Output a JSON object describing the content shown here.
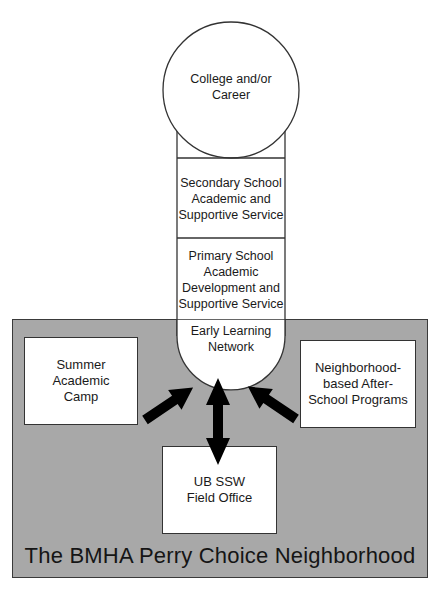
{
  "diagram": {
    "region": {
      "title": "The BMHA Perry Choice Neighborhood",
      "fill_color": "#a8a8a8"
    },
    "pipeline": [
      {
        "id": "college-career",
        "label": "College and/or\nCareer",
        "shape": "circle-top"
      },
      {
        "id": "secondary",
        "label": "Secondary School\nAcademic and\nSupportive Service",
        "shape": "rect"
      },
      {
        "id": "primary",
        "label": "Primary School\nAcademic\nDevelopment and\nSupportive Service",
        "shape": "rect"
      },
      {
        "id": "early-learning",
        "label": "Early Learning\nNetwork",
        "shape": "semicircle-bottom"
      }
    ],
    "boxes": {
      "summer": {
        "label": "Summer\nAcademic\nCamp"
      },
      "after_school": {
        "label": "Neighborhood-\nbased After-\nSchool Programs"
      },
      "field_office": {
        "label": "UB SSW\nField Office"
      }
    },
    "arrows": [
      {
        "from": "Summer Academic Camp",
        "to": "Early Learning Network",
        "type": "single"
      },
      {
        "from": "Neighborhood-based After-School Programs",
        "to": "Early Learning Network",
        "type": "single"
      },
      {
        "from": "UB SSW Field Office",
        "to": "Early Learning Network",
        "type": "double"
      }
    ]
  }
}
